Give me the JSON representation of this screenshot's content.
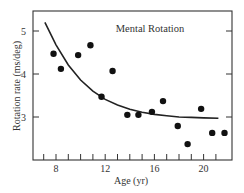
{
  "chart_data": {
    "type": "scatter",
    "title": "Mental Rotation",
    "xlabel": "Age (yr)",
    "ylabel": "Rotation rate (ms/deg)",
    "xlim": [
      6.2,
      22.4
    ],
    "ylim": [
      1.67,
      5.47
    ],
    "x_ticks": [
      8,
      12,
      16,
      20
    ],
    "x_minor_ticks": [
      7,
      8,
      9,
      10,
      11,
      12,
      13,
      14,
      15,
      16,
      17,
      18,
      19,
      20,
      21
    ],
    "y_ticks": [
      3,
      4,
      5
    ],
    "grid": false,
    "legend": null,
    "series": [
      {
        "name": "Observed",
        "kind": "points",
        "x": [
          7.8,
          8.4,
          9.8,
          10.8,
          11.7,
          12.6,
          13.8,
          14.7,
          15.8,
          16.7,
          17.9,
          18.7,
          19.8,
          20.7,
          21.7
        ],
        "y": [
          4.47,
          4.12,
          4.44,
          4.67,
          3.47,
          4.07,
          3.05,
          3.05,
          3.12,
          3.37,
          2.79,
          2.37,
          3.19,
          2.63,
          2.63
        ]
      },
      {
        "name": "Fitted exponential curve",
        "kind": "line",
        "x": [
          7.1,
          8,
          9,
          10,
          11,
          12,
          13,
          14,
          15,
          16,
          17,
          18,
          19,
          20,
          21.2
        ],
        "y": [
          5.2,
          4.68,
          4.21,
          3.86,
          3.6,
          3.41,
          3.28,
          3.18,
          3.11,
          3.06,
          3.03,
          3.0,
          2.99,
          2.98,
          2.97
        ]
      }
    ]
  }
}
